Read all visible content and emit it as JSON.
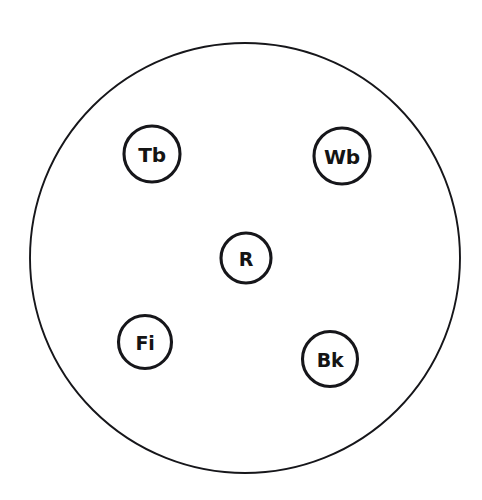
{
  "diagram": {
    "title": "",
    "background_color": "#ffffff",
    "stroke_color": "#16161a",
    "label_color": "#141414",
    "boundary": {
      "name": "outer-boundary-circle",
      "cx": 245,
      "cy": 258,
      "r": 215,
      "stroke_width": 1.9,
      "fill": "#ffffff"
    },
    "nodes": [
      {
        "id": "Tb",
        "label": "Tb",
        "cx": 152,
        "cy": 154,
        "r": 28,
        "font_size": 20,
        "stroke_width": 3.1,
        "fill": "#ffffff"
      },
      {
        "id": "Wb",
        "label": "Wb",
        "cx": 342,
        "cy": 156,
        "r": 28,
        "font_size": 20,
        "stroke_width": 3.1,
        "fill": "#ffffff"
      },
      {
        "id": "R",
        "label": "R",
        "cx": 246,
        "cy": 258,
        "r": 25,
        "font_size": 19,
        "stroke_width": 3.1,
        "fill": "#ffffff"
      },
      {
        "id": "Fi",
        "label": "Fi",
        "cx": 145,
        "cy": 342,
        "r": 26.5,
        "font_size": 19,
        "stroke_width": 3.1,
        "fill": "#ffffff"
      },
      {
        "id": "Bk",
        "label": "Bk",
        "cx": 330,
        "cy": 359,
        "r": 27.5,
        "font_size": 19,
        "stroke_width": 3.1,
        "fill": "#ffffff"
      }
    ]
  }
}
